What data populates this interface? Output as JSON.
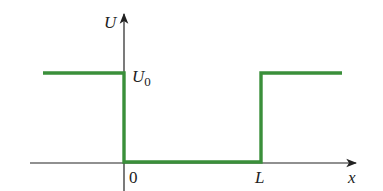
{
  "diagram": {
    "axes": {
      "y_label": "U",
      "x_label": "x"
    },
    "labels": {
      "u0_main": "U",
      "u0_sub": "0",
      "origin": "0",
      "L": "L"
    },
    "colors": {
      "potential": "#3a8f3a",
      "axis": "#222222"
    },
    "potential_segments": [
      {
        "from_x": "-inf",
        "to_x": "0",
        "U": "U0"
      },
      {
        "from_x": "0",
        "to_x": "L",
        "U": "0"
      },
      {
        "from_x": "L",
        "to_x": "+inf",
        "U": "U0"
      }
    ]
  }
}
